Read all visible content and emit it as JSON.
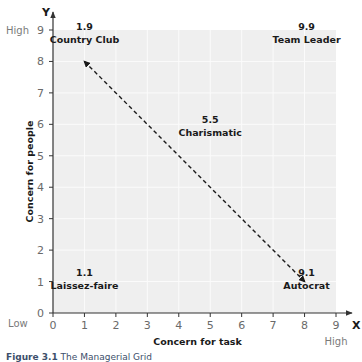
{
  "chart_data": {
    "type": "scatter",
    "title": "The Managerial Grid",
    "xlabel": "Concern for task",
    "ylabel": "Concern for people",
    "x_axis_letter": "X",
    "y_axis_letter": "Y",
    "xlim": [
      0,
      9
    ],
    "ylim": [
      0,
      9
    ],
    "x_ticks": [
      "0",
      "1",
      "2",
      "3",
      "4",
      "5",
      "6",
      "7",
      "8",
      "9"
    ],
    "y_ticks": [
      "0",
      "1",
      "2",
      "3",
      "4",
      "5",
      "6",
      "7",
      "8",
      "9"
    ],
    "x_low_label": "Low",
    "x_high_label": "High",
    "y_high_label": "High",
    "grid": true,
    "points": [
      {
        "value": "1.9",
        "name": "Country Club",
        "x": 1,
        "y": 9
      },
      {
        "value": "9.9",
        "name": "Team Leader",
        "x": 9,
        "y": 9
      },
      {
        "value": "5.5",
        "name": "Charismatic",
        "x": 5,
        "y": 5
      },
      {
        "value": "1.1",
        "name": "Laissez-faire",
        "x": 1,
        "y": 1
      },
      {
        "value": "9.1",
        "name": "Autocrat",
        "x": 9,
        "y": 1
      }
    ],
    "arrow": {
      "from": [
        1,
        8
      ],
      "to": [
        8,
        1
      ],
      "style": "dashed",
      "double_headed": true
    }
  },
  "caption": {
    "figure_label": "Figure 3.1",
    "text": "The Managerial Grid"
  }
}
